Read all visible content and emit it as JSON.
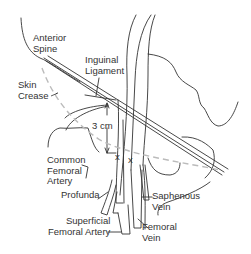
{
  "figure": {
    "colors": {
      "line": "#333333",
      "dashed": "#bbbbbb",
      "text": "#333333",
      "background": "#ffffff"
    }
  },
  "labels": {
    "anterior_spine": "Anterior\nSpine",
    "inguinal_ligament": "Inguinal\nLigament",
    "skin_crease": "Skin\nCrease",
    "distance": "3 cm",
    "common_femoral_artery": "Common\nFemoral\nArtery",
    "profunda": "Profunda",
    "superficial_femoral_artery": "Superficial\nFemoral Artery",
    "saphenous_vein": "Saphenous\nVein",
    "femoral_vein": "Femoral\nVein",
    "marker_x_1": "x",
    "marker_x_2": "x"
  }
}
